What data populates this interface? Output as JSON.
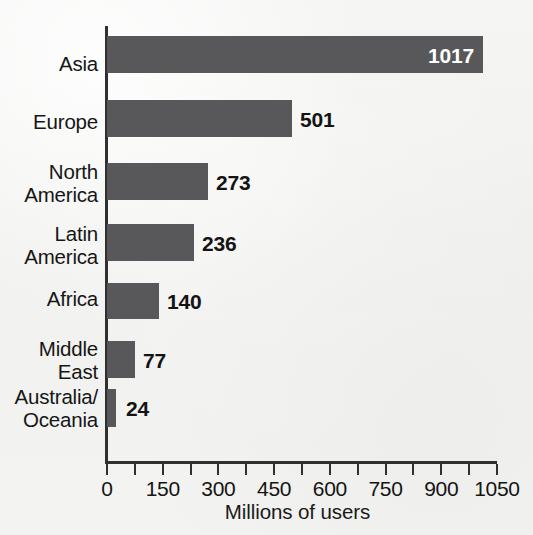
{
  "chart_data": {
    "type": "bar",
    "orientation": "horizontal",
    "title": "",
    "subtitle": "",
    "xlabel": "Millions of users",
    "ylabel": "",
    "categories": [
      "Asia",
      "Europe",
      "North America",
      "Latin America",
      "Africa",
      "Middle East",
      "Australia/Oceania"
    ],
    "category_lines": [
      [
        "Asia"
      ],
      [
        "Europe"
      ],
      [
        "North",
        "America"
      ],
      [
        "Latin",
        "America"
      ],
      [
        "Africa"
      ],
      [
        "Middle",
        "East"
      ],
      [
        "Australia/",
        "Oceania"
      ]
    ],
    "values": [
      1017,
      501,
      273,
      236,
      140,
      77,
      24
    ],
    "value_labels": [
      "1017",
      "501",
      "273",
      "236",
      "140",
      "77",
      "24"
    ],
    "xlim": [
      0,
      1050
    ],
    "xticks": [
      0,
      150,
      300,
      450,
      600,
      750,
      900,
      1050
    ],
    "xtick_labels": [
      "0",
      "150",
      "300",
      "450",
      "600",
      "750",
      "900",
      "1050"
    ],
    "minor_tick_interval": 75,
    "minor_ticks": [
      75,
      225,
      375,
      525,
      675,
      825,
      975
    ],
    "grid": false,
    "legend": false,
    "legend_position": "none",
    "bar_color": "#58585a",
    "value_label_color": "#141414",
    "inside_value_label_color": "#ffffff",
    "axis_color": "#303030",
    "background_color": "#f2f2f1",
    "labels_inside_bar": [
      true,
      false,
      false,
      false,
      false,
      false,
      false
    ]
  }
}
